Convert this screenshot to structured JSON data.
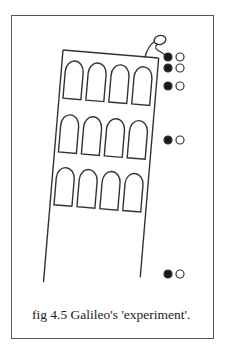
{
  "figure": {
    "caption": "fig 4.5 Galileo's 'experiment'.",
    "tower": {
      "arch_rows": 3,
      "arches_per_row": 4
    },
    "balls": [
      {
        "pair": 1,
        "heavy": "black",
        "light": "white",
        "y": 57
      },
      {
        "pair": 2,
        "heavy": "black",
        "light": "white",
        "y": 68
      },
      {
        "pair": 3,
        "heavy": "black",
        "light": "white",
        "y": 86
      },
      {
        "pair": 4,
        "heavy": "black",
        "light": "white",
        "y": 140
      },
      {
        "pair": 5,
        "heavy": "black",
        "light": "white",
        "y": 274
      }
    ],
    "colors": {
      "stroke": "#333333",
      "heavy_ball": "#1a1a1a",
      "light_ball": "#ffffff",
      "frame": "#555555"
    }
  }
}
